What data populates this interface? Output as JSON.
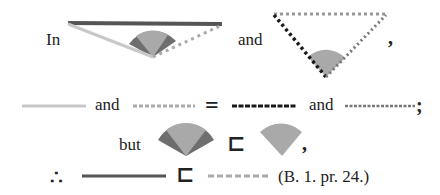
{
  "text": {
    "in": "In",
    "and1": "and",
    "comma1": ",",
    "and2": "and",
    "and3": "and",
    "semicolon": ";",
    "but": "but",
    "comma2": ",",
    "therefore": "∴",
    "citation": "(B. 1. pr. 24.)"
  },
  "symbols": {
    "equals": "=",
    "less_than": "⊏"
  },
  "colors": {
    "line_dark": "#555555",
    "line_light": "#c8c8c8",
    "line_dotted_gray": "#aaaaaa",
    "line_black_dotted": "#1a1a1a",
    "angle_light": "#a9a9a9",
    "angle_dark": "#6e6e6e",
    "text": "#222222"
  }
}
